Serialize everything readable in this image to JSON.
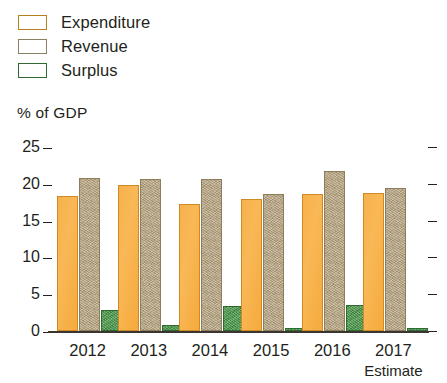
{
  "legend": {
    "items": [
      {
        "label": "Expenditure",
        "color": "#f9b857",
        "key": "expenditure"
      },
      {
        "label": "Revenue",
        "color": "#b3a17d",
        "key": "revenue"
      },
      {
        "label": "Surplus",
        "color": "#4e9b4d",
        "key": "surplus"
      }
    ]
  },
  "chart_data": {
    "type": "bar",
    "title": "",
    "subtitle": "",
    "xlabel": "",
    "ylabel": "% of GDP",
    "ylim": [
      0,
      25
    ],
    "yticks": [
      0,
      5,
      10,
      15,
      20,
      25
    ],
    "ytick_labels": [
      "0",
      "5",
      "10",
      "15",
      "20",
      "25"
    ],
    "grid": false,
    "legend_position": "top-left",
    "categories": [
      "2012",
      "2013",
      "2014",
      "2015",
      "2016",
      "2017"
    ],
    "category_annotations": [
      "",
      "",
      "",
      "",
      "",
      "Estimate"
    ],
    "series": [
      {
        "name": "Expenditure",
        "color": "#f9b857",
        "values": [
          18.3,
          19.9,
          17.3,
          18.0,
          18.6,
          18.8
        ]
      },
      {
        "name": "Revenue",
        "color": "#b3a17d",
        "values": [
          20.8,
          20.7,
          20.6,
          18.6,
          21.8,
          19.4
        ]
      },
      {
        "name": "Surplus",
        "color": "#4e9b4d",
        "values": [
          2.9,
          0.8,
          3.4,
          0.35,
          3.6,
          0.4
        ]
      }
    ]
  }
}
